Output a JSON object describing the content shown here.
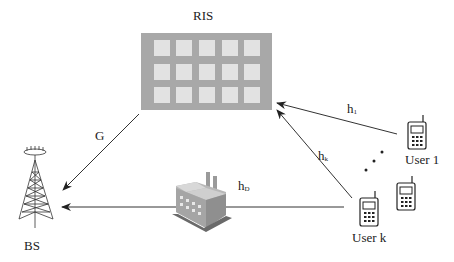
{
  "diagram": {
    "type": "RIS-assisted multi-user uplink system model",
    "nodes": {
      "ris": {
        "label": "RIS",
        "rows": 3,
        "cols": 5
      },
      "bs": {
        "label": "BS"
      },
      "user1": {
        "label": "User 1"
      },
      "userk": {
        "label": "User k"
      },
      "obstacle": {
        "label": "factory"
      }
    },
    "links": {
      "G": {
        "base": "G",
        "sub": "",
        "from": "RIS",
        "to": "BS"
      },
      "h1": {
        "base": "h",
        "sub": "1",
        "from": "User 1",
        "to": "RIS"
      },
      "hk": {
        "base": "h",
        "sub": "k",
        "from": "User k",
        "to": "RIS"
      },
      "hD": {
        "base": "h",
        "sub": "D",
        "from": "User k",
        "to": "BS"
      }
    },
    "ellipsis": "..."
  },
  "colors": {
    "ris_frame": "#a8a8a8",
    "ris_element": "#e2e2e2",
    "line": "#333333"
  }
}
